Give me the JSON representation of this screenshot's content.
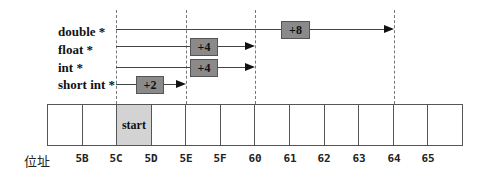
{
  "diagram": {
    "pointer_types": [
      {
        "label": "double *",
        "step": "+8",
        "top": 25,
        "line_y": 29,
        "line_start": 116,
        "line_end": 394,
        "box_left": 281,
        "box_width": 27
      },
      {
        "label": "float *",
        "step": "+4",
        "top": 43,
        "line_y": 46,
        "line_start": 116,
        "line_end": 255,
        "box_left": 190,
        "box_width": 26
      },
      {
        "label": "int *",
        "step": "+4",
        "top": 61,
        "line_y": 67,
        "line_start": 116,
        "line_end": 255,
        "box_left": 190,
        "box_width": 26
      },
      {
        "label": "short int *",
        "step": "+2",
        "top": 78,
        "line_y": 84,
        "line_start": 116,
        "line_end": 186,
        "box_left": 136,
        "box_width": 26
      }
    ],
    "dashed_markers_at": [
      "5C",
      "5E",
      "60",
      "64"
    ],
    "memory": {
      "cells": [
        "",
        "",
        "start",
        "",
        "",
        "",
        "",
        "",
        "",
        "",
        "",
        ""
      ],
      "highlight_index": 2,
      "highlight_color": "#d3d3d3"
    },
    "address_axis": {
      "title": "位址",
      "labels": [
        "5B",
        "5C",
        "5D",
        "5E",
        "5F",
        "60",
        "61",
        "62",
        "63",
        "64",
        "65"
      ]
    },
    "colors": {
      "step_box": "#8a8a8a",
      "line": "#444444"
    }
  }
}
